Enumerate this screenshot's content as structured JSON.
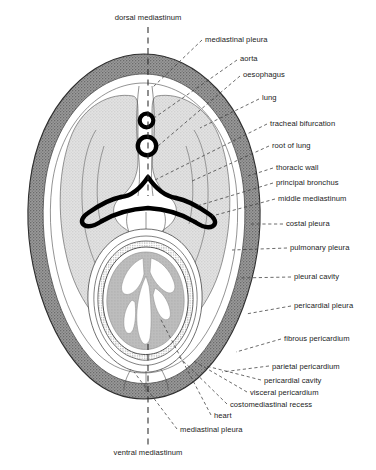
{
  "figure": {
    "type": "anatomical-cross-section"
  },
  "colors": {
    "thoracic_wall": "#8d8d8d",
    "lung": "#d8d8d8",
    "heart_muscle": "#b9b9b9",
    "pleural_cavity": "#ffffff",
    "outline": "#3a3a3a",
    "heavy_structure": "#000000",
    "label_text": "#1b1b1b",
    "leader_line": "#3b3b3b"
  },
  "labels": {
    "top": {
      "text": "dorsal mediastinum",
      "x": 148,
      "y": 20,
      "anchor": "middle"
    },
    "bottom": {
      "text": "ventral mediastinum",
      "x": 148,
      "y": 455,
      "anchor": "middle"
    },
    "right": [
      {
        "text": "mediastinal pleura",
        "x": 205,
        "y": 42,
        "anchor": "start"
      },
      {
        "text": "aorta",
        "x": 240,
        "y": 61,
        "anchor": "start"
      },
      {
        "text": "oesophagus",
        "x": 243,
        "y": 77,
        "anchor": "start"
      },
      {
        "text": "lung",
        "x": 262,
        "y": 100,
        "anchor": "start"
      },
      {
        "text": "tracheal bifurcation",
        "x": 270,
        "y": 126,
        "anchor": "start"
      },
      {
        "text": "root of lung",
        "x": 272,
        "y": 148,
        "anchor": "start"
      },
      {
        "text": "thoracic wall",
        "x": 276,
        "y": 170,
        "anchor": "start"
      },
      {
        "text": "principal bronchus",
        "x": 276,
        "y": 185,
        "anchor": "start"
      },
      {
        "text": "middle mediastinum",
        "x": 278,
        "y": 201,
        "anchor": "start"
      },
      {
        "text": "costal pleura",
        "x": 286,
        "y": 226,
        "anchor": "start"
      },
      {
        "text": "pulmonary pleura",
        "x": 290,
        "y": 250,
        "anchor": "start"
      },
      {
        "text": "pleural cavity",
        "x": 294,
        "y": 279,
        "anchor": "start"
      },
      {
        "text": "pericardial pleura",
        "x": 294,
        "y": 308,
        "anchor": "start"
      },
      {
        "text": "fibrous pericardium",
        "x": 284,
        "y": 341,
        "anchor": "start"
      },
      {
        "text": "parietal pericardium",
        "x": 272,
        "y": 369,
        "anchor": "start"
      },
      {
        "text": "pericardial cavity",
        "x": 264,
        "y": 383,
        "anchor": "start"
      },
      {
        "text": "visceral pericardium",
        "x": 250,
        "y": 395,
        "anchor": "start"
      },
      {
        "text": "costomediastinal recess",
        "x": 230,
        "y": 407,
        "anchor": "start"
      },
      {
        "text": "heart",
        "x": 214,
        "y": 418,
        "anchor": "start"
      },
      {
        "text": "mediastinal pleura",
        "x": 180,
        "y": 432,
        "anchor": "start"
      }
    ]
  },
  "structures": [
    {
      "name": "thoracic-wall",
      "shading": "dark-gray-stipple"
    },
    {
      "name": "lung-left",
      "shading": "light-gray-stipple"
    },
    {
      "name": "lung-right",
      "shading": "light-gray-stipple"
    },
    {
      "name": "pleural-cavity",
      "shading": "white"
    },
    {
      "name": "aorta",
      "shading": "heavy-ring"
    },
    {
      "name": "oesophagus",
      "shading": "heavy-ring"
    },
    {
      "name": "tracheal-bifurcation",
      "shading": "heavy-outline"
    },
    {
      "name": "principal-bronchus-left",
      "shading": "heavy-outline"
    },
    {
      "name": "principal-bronchus-right",
      "shading": "heavy-outline"
    },
    {
      "name": "heart",
      "shading": "mid-gray"
    },
    {
      "name": "pericardium",
      "shading": "thin-outline"
    }
  ]
}
